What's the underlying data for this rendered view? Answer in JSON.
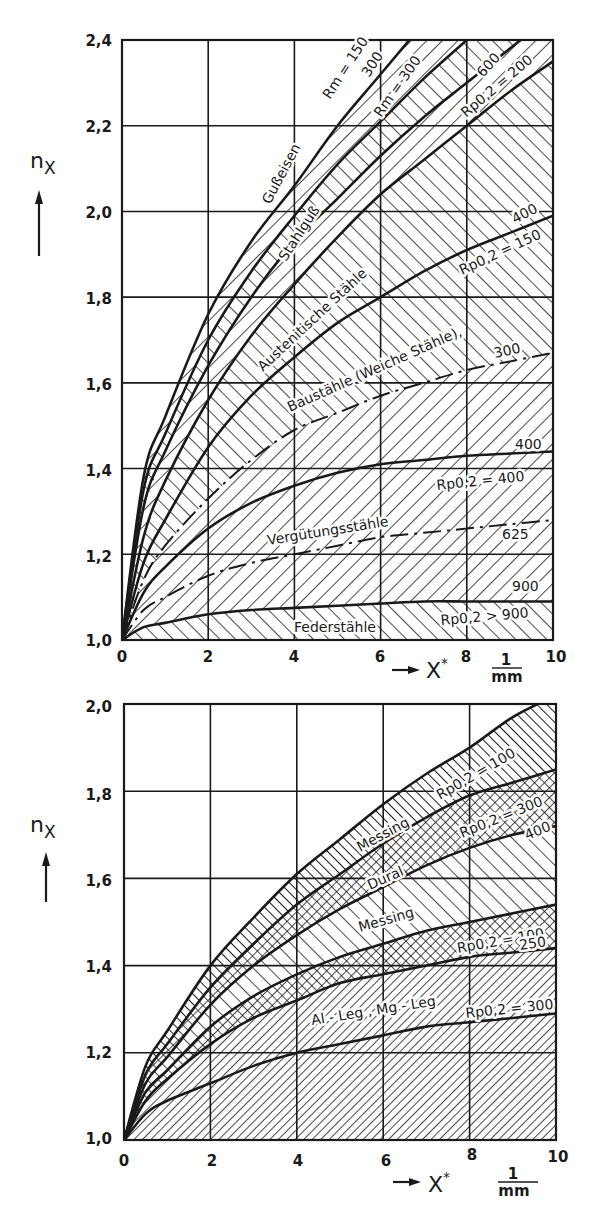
{
  "chart_data": [
    {
      "type": "area",
      "title": "Kerbwirkung – Stähle und Gusswerkstoffe",
      "ylabel": "n_X",
      "xlabel": "X*",
      "x_unit": "1/mm",
      "xlim": [
        0,
        10
      ],
      "ylim": [
        1.0,
        2.4
      ],
      "grid": true,
      "x_ticks": [
        "0",
        "2",
        "4",
        "6",
        "8",
        "10"
      ],
      "y_ticks": [
        "1,0",
        "1,2",
        "1,4",
        "1,6",
        "1,8",
        "2,0",
        "2,2",
        "2,4"
      ],
      "x": [
        0,
        0.5,
        1,
        2,
        3,
        4,
        5,
        6,
        7,
        8,
        9,
        10
      ],
      "series": [
        {
          "name": "Rm = 150",
          "style": "solid",
          "values": [
            1.0,
            1.38,
            1.52,
            1.76,
            1.93,
            2.06,
            2.2,
            2.32,
            2.44,
            null,
            null,
            null
          ]
        },
        {
          "name": "Rm = 300 (Gußeisen)",
          "style": "solid",
          "values": [
            1.0,
            1.35,
            1.48,
            1.7,
            1.86,
            1.99,
            2.11,
            2.21,
            2.31,
            2.4,
            null,
            null
          ]
        },
        {
          "name": "Rm = 300 (Stahlguß)",
          "style": "solid",
          "values": [
            1.0,
            1.31,
            1.44,
            1.64,
            1.8,
            1.93,
            2.03,
            2.13,
            2.22,
            2.3,
            2.38,
            null
          ]
        },
        {
          "name": "Rp0,2 = 200 / 600",
          "style": "solid",
          "values": [
            1.0,
            1.24,
            1.37,
            1.56,
            1.71,
            1.83,
            1.94,
            2.04,
            2.12,
            2.2,
            2.28,
            2.35
          ]
        },
        {
          "name": "Rp0,2 = 150 / 400",
          "style": "solid",
          "values": [
            1.0,
            1.18,
            1.28,
            1.45,
            1.57,
            1.66,
            1.74,
            1.8,
            1.86,
            1.91,
            1.95,
            1.99
          ]
        },
        {
          "name": "300",
          "style": "dashed",
          "values": [
            1.0,
            1.14,
            1.22,
            1.33,
            1.42,
            1.49,
            1.53,
            1.57,
            1.6,
            1.63,
            1.65,
            1.67
          ]
        },
        {
          "name": "Rp0,2 = 400",
          "style": "solid",
          "values": [
            1.0,
            1.11,
            1.17,
            1.26,
            1.32,
            1.36,
            1.39,
            1.41,
            1.42,
            1.43,
            1.435,
            1.44
          ]
        },
        {
          "name": "625",
          "style": "dashed",
          "values": [
            1.0,
            1.07,
            1.1,
            1.15,
            1.18,
            1.2,
            1.22,
            1.24,
            1.25,
            1.26,
            1.27,
            1.28
          ]
        },
        {
          "name": "Rp0,2 > 900",
          "style": "solid",
          "values": [
            1.0,
            1.03,
            1.04,
            1.06,
            1.07,
            1.075,
            1.08,
            1.085,
            1.09,
            1.09,
            1.09,
            1.09
          ]
        }
      ],
      "regions": [
        "Gußeisen",
        "Stahlguß",
        "Austenitische Stähle",
        "Baustähle (Weiche Stähle)",
        "Vergütungsstähle",
        "Federstähle"
      ],
      "annotations": [
        "Rm = 150",
        "300",
        "Rm = 300",
        "600",
        "Rp0,2 = 200",
        "400",
        "Rp0,2 = 150",
        "300",
        "400",
        "Rp0,2 = 400",
        "625",
        "900",
        "Rp0,2 > 900"
      ]
    },
    {
      "type": "area",
      "title": "Kerbwirkung – Nichteisenmetalle",
      "ylabel": "n_X",
      "xlabel": "X*",
      "x_unit": "1/mm",
      "xlim": [
        0,
        10
      ],
      "ylim": [
        1.0,
        2.0
      ],
      "grid": true,
      "x_ticks": [
        "0",
        "2",
        "4",
        "6",
        "8",
        "10"
      ],
      "y_ticks": [
        "1,0",
        "1,2",
        "1,4",
        "1,6",
        "1,8",
        "2,0"
      ],
      "x": [
        0,
        0.5,
        1,
        2,
        3,
        4,
        5,
        6,
        7,
        8,
        9,
        10
      ],
      "series": [
        {
          "name": "Messing Rp0,2 = 100",
          "style": "solid",
          "values": [
            1.0,
            1.17,
            1.25,
            1.4,
            1.51,
            1.61,
            1.69,
            1.77,
            1.84,
            1.9,
            1.97,
            2.02
          ]
        },
        {
          "name": "Messing/Dural Rp0,2 = 300",
          "style": "solid",
          "values": [
            1.0,
            1.15,
            1.22,
            1.35,
            1.45,
            1.54,
            1.61,
            1.68,
            1.74,
            1.79,
            1.82,
            1.85
          ]
        },
        {
          "name": "Dural 400",
          "style": "solid",
          "values": [
            1.0,
            1.13,
            1.19,
            1.31,
            1.4,
            1.47,
            1.53,
            1.58,
            1.63,
            1.67,
            1.7,
            1.72
          ]
        },
        {
          "name": "Messing Rp0,2 = 100 (unten)",
          "style": "solid",
          "values": [
            1.0,
            1.11,
            1.16,
            1.26,
            1.33,
            1.38,
            1.42,
            1.45,
            1.48,
            1.5,
            1.52,
            1.54
          ]
        },
        {
          "name": "250",
          "style": "solid",
          "values": [
            1.0,
            1.09,
            1.14,
            1.22,
            1.28,
            1.32,
            1.36,
            1.38,
            1.4,
            1.42,
            1.43,
            1.44
          ]
        },
        {
          "name": "Al-Leg, Mg-Leg Rp0,2 = 300",
          "style": "solid",
          "values": [
            1.0,
            1.06,
            1.09,
            1.13,
            1.17,
            1.2,
            1.22,
            1.24,
            1.26,
            1.27,
            1.28,
            1.29
          ]
        }
      ],
      "regions": [
        "Messing",
        "Dural",
        "Messing",
        "Al - Leg, Mg - Leg"
      ],
      "annotations": [
        "Rp0,2 = 100",
        "Rp0,2 = 300",
        "400",
        "Rp0,2 = 100",
        "250",
        "Rp0,2 = 300"
      ]
    }
  ],
  "top_chart": {
    "y_label": "n",
    "y_label_sub": "X",
    "x_label": "X",
    "x_label_sup": "*",
    "x_unit_num": "1",
    "x_unit_den": "mm",
    "ticks_x": [
      "0",
      "2",
      "4",
      "6",
      "8",
      "10"
    ],
    "ticks_y": [
      "2,4",
      "2,2",
      "2,0",
      "1,8",
      "1,6",
      "1,4",
      "1,2",
      "1,0"
    ],
    "labels": {
      "gusseisen": "Gußeisen",
      "stahlguss": "Stahlguß",
      "austenitisch": "Austenitische Stähle",
      "baustaehle": "Baustähle (Weiche Stähle),",
      "verguetung": "Vergütungsstähle",
      "feder": "Federstähle",
      "rm150": "Rm = 150",
      "rm150_300": "300",
      "rm300": "Rm = 300",
      "n600": "600",
      "rp200": "Rp0,2 = 200",
      "n400a": "400",
      "rp150": "Rp0,2 = 150",
      "n300": "300",
      "n400b": "400",
      "rp400": "Rp0,2 = 400",
      "n625": "625",
      "n900": "900",
      "rp900": "Rp0,2 > 900"
    }
  },
  "bottom_chart": {
    "y_label": "n",
    "y_label_sub": "X",
    "x_label": "X",
    "x_label_sup": "*",
    "x_unit_num": "1",
    "x_unit_den": "mm",
    "ticks_x": [
      "0",
      "2",
      "4",
      "6",
      "8",
      "10"
    ],
    "ticks_y": [
      "2,0",
      "1,8",
      "1,6",
      "1,4",
      "1,2",
      "1,0"
    ],
    "labels": {
      "messing1": "Messing",
      "dural": "Dural",
      "messing2": "Messing",
      "alleg": "Al - Leg , Mg - Leg",
      "rp100a": "Rp0,2 = 100",
      "rp300a": "Rp0,2 = 300",
      "n400": "400",
      "rp100b": "Rp0,2 = 100",
      "n250": "250",
      "rp300b": "Rp0,2 = 300"
    }
  }
}
